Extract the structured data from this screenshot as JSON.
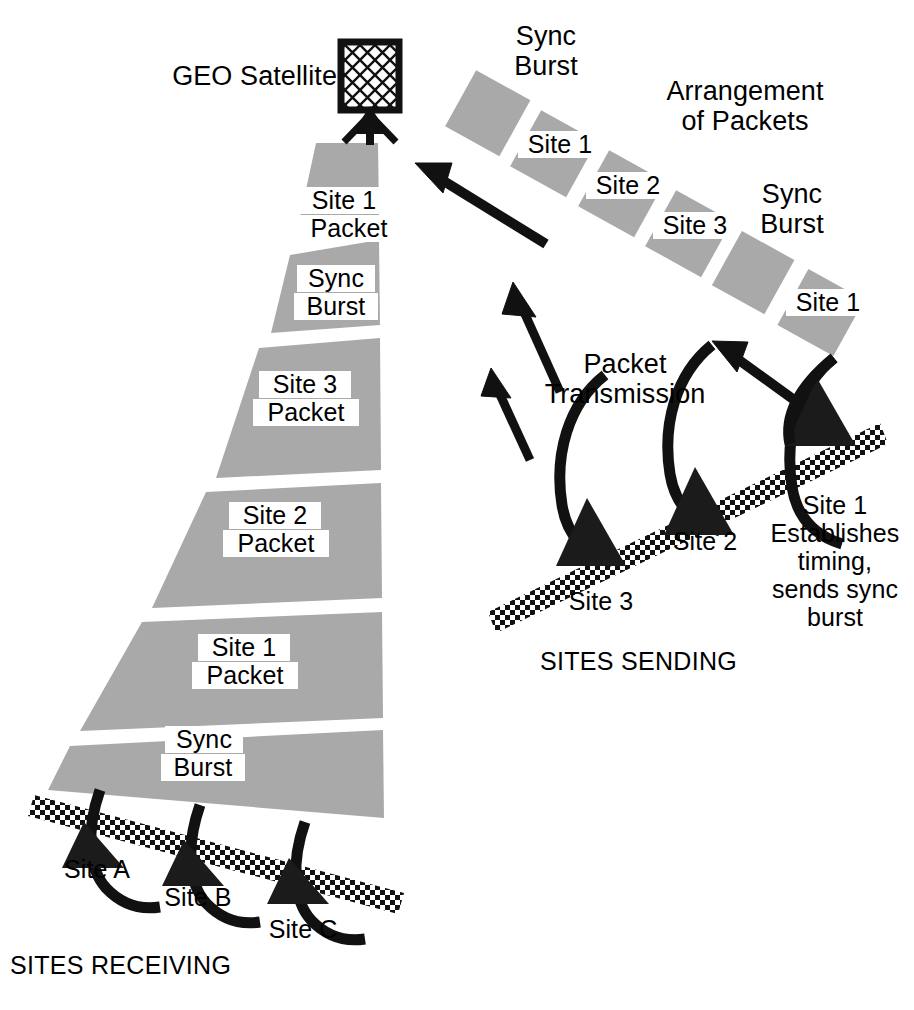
{
  "diagram": {
    "colors": {
      "packet_gray": "#a9a9a9",
      "ink": "#111111",
      "paper": "#ffffff"
    }
  },
  "satellite": {
    "label": "GEO Satellite",
    "icon": "satellite-antenna-icon"
  },
  "receiving": {
    "caption": "SITES RECEIVING",
    "funnel_segments": [
      {
        "id": "seg-site1-packet-top",
        "line1": "Site 1",
        "line2": "Packet"
      },
      {
        "id": "seg-sync-burst-upper",
        "line1": "Sync",
        "line2": "Burst"
      },
      {
        "id": "seg-site3-packet",
        "line1": "Site 3",
        "line2": "Packet"
      },
      {
        "id": "seg-site2-packet",
        "line1": "Site 2",
        "line2": "Packet"
      },
      {
        "id": "seg-site1-packet",
        "line1": "Site 1",
        "line2": "Packet"
      },
      {
        "id": "seg-sync-burst-lower",
        "line1": "Sync",
        "line2": "Burst"
      }
    ],
    "sites": [
      {
        "id": "site-a",
        "label": "Site A"
      },
      {
        "id": "site-b",
        "label": "Site B"
      },
      {
        "id": "site-c",
        "label": "Site C"
      }
    ]
  },
  "arrangement": {
    "title_line1": "Arrangement",
    "title_line2": "of Packets",
    "sync_label_left_line1": "Sync",
    "sync_label_left_line2": "Burst",
    "sync_label_right_line1": "Sync",
    "sync_label_right_line2": "Burst",
    "packets": [
      {
        "id": "pkt-sync-1",
        "label": "",
        "kind": "sync"
      },
      {
        "id": "pkt-site1-a",
        "label": "Site 1",
        "kind": "data"
      },
      {
        "id": "pkt-site2",
        "label": "Site 2",
        "kind": "data"
      },
      {
        "id": "pkt-site3",
        "label": "Site 3",
        "kind": "data"
      },
      {
        "id": "pkt-sync-2",
        "label": "",
        "kind": "sync"
      },
      {
        "id": "pkt-site1-b",
        "label": "Site 1",
        "kind": "data"
      }
    ]
  },
  "transmission": {
    "label_line1": "Packet",
    "label_line2": "Transmission",
    "arrow_count": 3
  },
  "sending": {
    "caption": "SITES SENDING",
    "sites": [
      {
        "id": "send-site-3",
        "label": "Site 3"
      },
      {
        "id": "send-site-2",
        "label": "Site 2"
      },
      {
        "id": "send-site-1",
        "label": "Site 1"
      }
    ],
    "site1_note": {
      "line1": "Site 1",
      "line2": "Establishes",
      "line3": "timing,",
      "line4": "sends sync",
      "line5": "burst"
    }
  }
}
